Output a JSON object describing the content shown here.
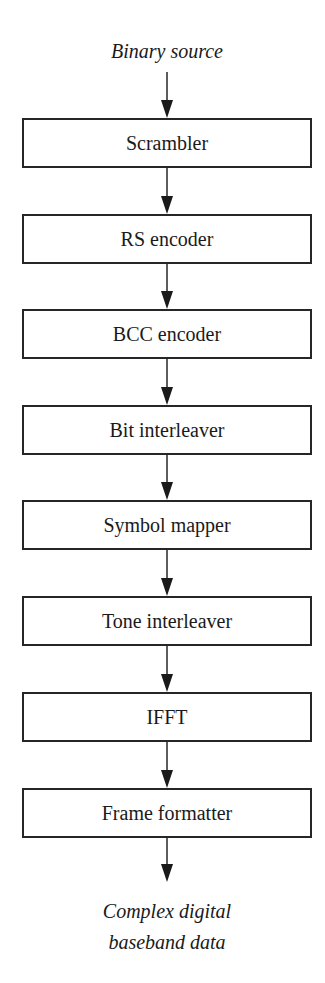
{
  "diagram": {
    "type": "flowchart",
    "direction": "top-to-bottom",
    "input_label": "Binary source",
    "output_label_lines": [
      "Complex digital",
      "baseband data"
    ],
    "blocks": [
      {
        "label": "Scrambler"
      },
      {
        "label": "RS encoder"
      },
      {
        "label": "BCC encoder"
      },
      {
        "label": "Bit interleaver"
      },
      {
        "label": "Symbol mapper"
      },
      {
        "label": "Tone interleaver"
      },
      {
        "label": "IFFT"
      },
      {
        "label": "Frame formatter"
      }
    ],
    "edges": [
      {
        "from": "Binary source",
        "to": "Scrambler"
      },
      {
        "from": "Scrambler",
        "to": "RS encoder"
      },
      {
        "from": "RS encoder",
        "to": "BCC encoder"
      },
      {
        "from": "BCC encoder",
        "to": "Bit interleaver"
      },
      {
        "from": "Bit interleaver",
        "to": "Symbol mapper"
      },
      {
        "from": "Symbol mapper",
        "to": "Tone interleaver"
      },
      {
        "from": "Tone interleaver",
        "to": "IFFT"
      },
      {
        "from": "IFFT",
        "to": "Frame formatter"
      },
      {
        "from": "Frame formatter",
        "to": "Complex digital baseband data"
      }
    ],
    "colors": {
      "stroke": "#262626",
      "text": "#1a1a1a",
      "background": "#ffffff"
    }
  }
}
